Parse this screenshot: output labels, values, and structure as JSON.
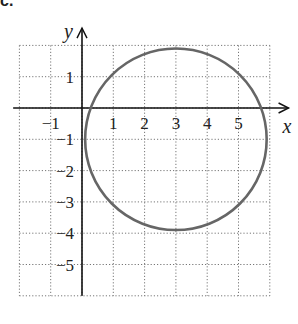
{
  "part_label": "c.",
  "chart_data": {
    "type": "scatter",
    "title": "",
    "xlabel": "x",
    "ylabel": "y",
    "xlim": [
      -2,
      6
    ],
    "ylim": [
      -6,
      2
    ],
    "grid": true,
    "grid_style": "dotted",
    "x_ticks": [
      -1,
      1,
      2,
      3,
      4,
      5
    ],
    "y_ticks": [
      1,
      -1,
      -2,
      -3,
      -4,
      -5
    ],
    "x_tick_labels": [
      "−1",
      "1",
      "2",
      "3",
      "4",
      "5"
    ],
    "y_tick_labels": [
      "1",
      "−1",
      "−2",
      "−3",
      "−4",
      "−5"
    ],
    "shapes": [
      {
        "type": "circle",
        "center": [
          3,
          -1
        ],
        "radius": 2.9,
        "color": "#666666"
      }
    ]
  }
}
